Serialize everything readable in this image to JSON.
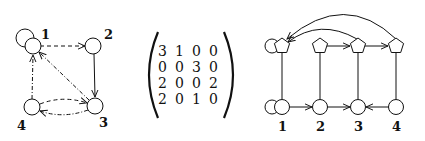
{
  "left_graph": {
    "nodes": [
      {
        "id": "1",
        "label": "1"
      },
      {
        "id": "2",
        "label": "2"
      },
      {
        "id": "3",
        "label": "3"
      },
      {
        "id": "4",
        "label": "4"
      }
    ],
    "edges": [
      {
        "from": "1",
        "to": "1",
        "style": "solid",
        "note": "self-loop"
      },
      {
        "from": "1",
        "to": "2",
        "style": "dashed"
      },
      {
        "from": "2",
        "to": "3",
        "style": "solid"
      },
      {
        "from": "3",
        "to": "1",
        "style": "dash-dot"
      },
      {
        "from": "4",
        "to": "1",
        "style": "dash-dot"
      },
      {
        "from": "4",
        "to": "3",
        "style": "dashed"
      },
      {
        "from": "3",
        "to": "4",
        "style": "dash-dot"
      }
    ]
  },
  "matrix": {
    "rows": [
      [
        "3",
        "1",
        "0",
        "0"
      ],
      [
        "0",
        "0",
        "3",
        "0"
      ],
      [
        "2",
        "0",
        "0",
        "2"
      ],
      [
        "2",
        "0",
        "1",
        "0"
      ]
    ]
  },
  "right_graph": {
    "column_labels": [
      "1",
      "2",
      "3",
      "4"
    ],
    "top_row_shape": "pentagon",
    "bottom_row_shape": "circle",
    "edges": [
      {
        "from": "bottom-1",
        "to": "bottom-1",
        "style": "solid",
        "note": "self-loop"
      },
      {
        "from": "top-1",
        "to": "top-1",
        "style": "solid",
        "note": "self-loop"
      },
      {
        "from": "bottom-1",
        "to": "bottom-2"
      },
      {
        "from": "bottom-2",
        "to": "bottom-3"
      },
      {
        "from": "bottom-4",
        "to": "bottom-3"
      },
      {
        "from": "top-2",
        "to": "top-3"
      },
      {
        "from": "top-3",
        "to": "top-4"
      },
      {
        "from": "top-3",
        "to": "top-1",
        "note": "arc"
      },
      {
        "from": "top-4",
        "to": "top-1",
        "note": "arc"
      }
    ]
  }
}
